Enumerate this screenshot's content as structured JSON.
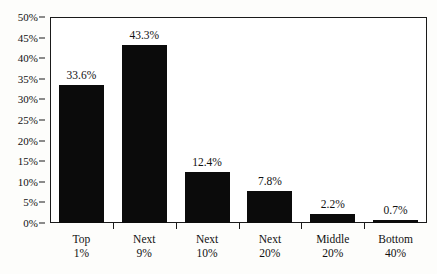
{
  "chart_data": {
    "type": "bar",
    "title": "",
    "subtitle": "",
    "xlabel": "",
    "ylabel": "",
    "categories": [
      "Top 1%",
      "Next 9%",
      "Next 10%",
      "Next 20%",
      "Middle 20%",
      "Bottom 40%"
    ],
    "values": [
      33.6,
      43.3,
      12.4,
      7.8,
      2.2,
      0.7
    ],
    "value_labels": [
      "33.6%",
      "43.3%",
      "12.4%",
      "7.8%",
      "2.2%",
      "0.7%"
    ],
    "ylim": [
      0,
      50
    ],
    "ytick_labels": [
      "0%",
      "5%",
      "10%",
      "15%",
      "20%",
      "25%",
      "30%",
      "35%",
      "40%",
      "45%",
      "50%"
    ],
    "ytick_values": [
      0,
      5,
      10,
      15,
      20,
      25,
      30,
      35,
      40,
      45,
      50
    ],
    "grid": false,
    "legend": null,
    "bar_color": "#0b0b0b",
    "axis_color": "#1a1a1a",
    "background_color": "#ffffff"
  }
}
